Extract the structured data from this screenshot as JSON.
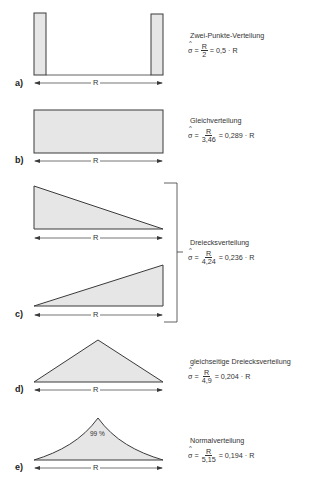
{
  "panels": [
    {
      "id": "a",
      "label": "a)",
      "title": "Zwei-Punkte-Verteilung",
      "shape": "two-point",
      "range_label": "R",
      "formula": {
        "sigma": "σ",
        "hat": "^",
        "eq1": "=",
        "numerator": "R",
        "denominator": "2",
        "eq2": "= 0,5 · R"
      }
    },
    {
      "id": "b",
      "label": "b)",
      "title": "Gleichverteilung",
      "shape": "uniform",
      "range_label": "R",
      "formula": {
        "sigma": "σ",
        "hat": "^",
        "eq1": "=",
        "numerator": "R",
        "denominator": "3,46",
        "eq2": "= 0,289 · R"
      }
    },
    {
      "id": "c",
      "label": "c)",
      "title": "Dreiecksverteilung",
      "shape": "right-triangle",
      "range_label_top": "R",
      "range_label_bottom": "R",
      "formula": {
        "sigma": "σ",
        "hat": "^",
        "eq1": "=",
        "numerator": "R",
        "denominator": "4,24",
        "eq2": "= 0,236 · R"
      }
    },
    {
      "id": "d",
      "label": "d)",
      "title": "gleichseitige Dreiecksverteilung",
      "shape": "isosceles-triangle",
      "range_label": "R",
      "formula": {
        "sigma": "σ",
        "hat": "^",
        "eq1": "=",
        "numerator": "R",
        "denominator": "4,9",
        "eq2": "= 0,204 · R"
      }
    },
    {
      "id": "e",
      "label": "e)",
      "title": "Normalverteilung",
      "shape": "normal",
      "range_label": "R",
      "coverage": "99 %",
      "formula": {
        "sigma": "σ",
        "hat": "^",
        "eq1": "=",
        "numerator": "R",
        "denominator": "5,15",
        "eq2": "= 0,194 · R"
      }
    }
  ],
  "colors": {
    "fill": "#e6e6e6",
    "stroke": "#3a3a3a",
    "background": "#ffffff"
  }
}
